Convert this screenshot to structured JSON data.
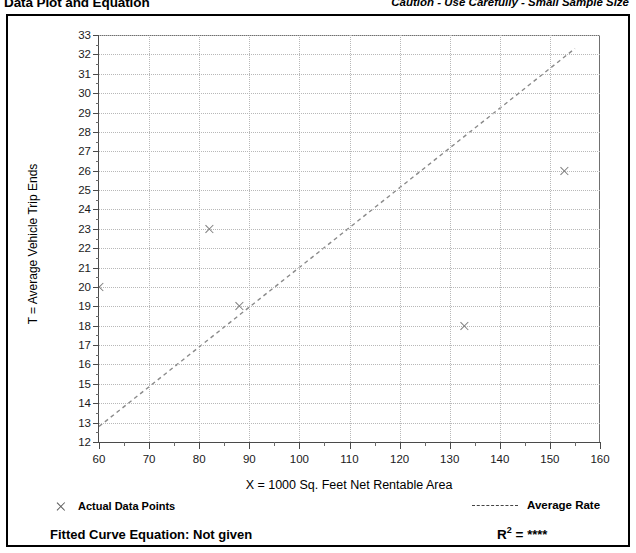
{
  "header": {
    "title": "Data Plot and Equation",
    "caution": "Caution - Use Carefully - Small Sample Size"
  },
  "legend": {
    "data_points_label": "Actual Data Points",
    "average_rate_label": "Average Rate",
    "fitted_curve_label": "Fitted Curve Equation:  Not given",
    "r2_label": "R",
    "r2_exponent": "2",
    "r2_equals": " = ",
    "r2_value": "****"
  },
  "colors": {
    "axis": "#4a4a4a",
    "grid": "#b8b8b8",
    "marker": "#7d7d7d",
    "trend": "#8a8a8a",
    "text": "#000000"
  },
  "chart_data": {
    "type": "scatter",
    "title": "Data Plot and Equation",
    "xlabel": "X = 1000 Sq. Feet Net Rentable Area",
    "ylabel": "T = Average Vehicle Trip Ends",
    "xlim": [
      60,
      160
    ],
    "ylim": [
      12,
      33
    ],
    "xticks": [
      60,
      70,
      80,
      90,
      100,
      110,
      120,
      130,
      140,
      150,
      160
    ],
    "xtick_labels": [
      "60",
      "70",
      "80",
      "90",
      "100",
      "110",
      "120",
      "130",
      "140",
      "150",
      "160"
    ],
    "xminor_step": 5,
    "yticks": [
      12,
      13,
      14,
      15,
      16,
      17,
      18,
      19,
      20,
      21,
      22,
      23,
      24,
      25,
      26,
      27,
      28,
      29,
      30,
      31,
      32,
      33
    ],
    "ytick_labels": [
      "12",
      "13",
      "14",
      "15",
      "16",
      "17",
      "18",
      "19",
      "20",
      "21",
      "22",
      "23",
      "24",
      "25",
      "26",
      "27",
      "28",
      "29",
      "30",
      "31",
      "32",
      "33"
    ],
    "grid": true,
    "grid_style": "dotted",
    "legend_position": "below-plot",
    "series": [
      {
        "name": "Actual Data Points",
        "type": "scatter",
        "marker": "x",
        "points": [
          {
            "x": 60,
            "y": 20
          },
          {
            "x": 82,
            "y": 23
          },
          {
            "x": 88,
            "y": 19
          },
          {
            "x": 133,
            "y": 18
          },
          {
            "x": 153,
            "y": 26
          }
        ]
      },
      {
        "name": "Average Rate",
        "type": "line",
        "style": "dashed",
        "points": [
          {
            "x": 60,
            "y": 12.8
          },
          {
            "x": 155,
            "y": 32.3
          }
        ]
      }
    ],
    "annotations": {
      "caution": "Caution - Use Carefully - Small Sample Size",
      "fitted_curve_equation": "Not given",
      "r_squared": "****"
    }
  }
}
